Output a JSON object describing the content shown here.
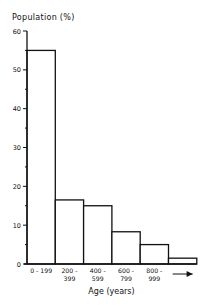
{
  "chart_data": {
    "type": "bar",
    "title": "",
    "ylabel": "Population (%)",
    "xlabel": "Age (years)",
    "categories": [
      "0 - 199",
      "200 - 399",
      "400 - 599",
      "600 - 799",
      "800 - 999",
      ">1000"
    ],
    "category_labels": [
      [
        "0 - 199"
      ],
      [
        "200 -",
        "399"
      ],
      [
        "400 -",
        "599"
      ],
      [
        "600 -",
        "799"
      ],
      [
        "800 -",
        "999"
      ],
      [
        "→"
      ]
    ],
    "values": [
      55,
      16.5,
      15,
      8.3,
      5,
      1.5
    ],
    "ylim": [
      0,
      60
    ],
    "yticks": [
      0,
      10,
      20,
      30,
      40,
      50,
      60
    ],
    "minor_ticks": [
      5,
      15,
      25,
      35,
      45,
      55
    ],
    "grid": false,
    "legend": null,
    "bar_style": {
      "fill": "#ffffff",
      "stroke": "#111111"
    },
    "annotations": [
      "arrow under last bar indicating ages beyond 1000 years"
    ]
  }
}
